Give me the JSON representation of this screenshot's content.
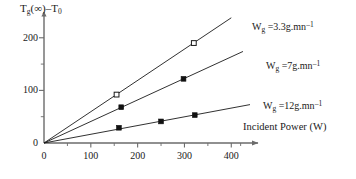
{
  "chart_data": {
    "type": "scatter",
    "title": "",
    "subtitle": "",
    "ylabel": "Tg(∞)–T0",
    "ylabel_parts": {
      "base": "T",
      "sub": "g",
      "mid": "(∞)–T",
      "sub2": "0"
    },
    "xlabel": "Incident Power (W)",
    "xlim": [
      0,
      440
    ],
    "ylim": [
      0,
      230
    ],
    "xticks": [
      0,
      100,
      200,
      300,
      400
    ],
    "xticklabels": [
      "0",
      "100",
      "200",
      "300",
      "400"
    ],
    "xminorticks": [
      50,
      150,
      250,
      350,
      420
    ],
    "yticks": [
      0,
      50,
      100,
      150,
      200
    ],
    "yticklabels": [
      "0",
      "",
      "100",
      "",
      "200"
    ],
    "grid": false,
    "legend_position": "inline-right-end-of-line",
    "axis_color": "#6b6b6b",
    "line_color": "#1a1a1a",
    "marker_fill": "#111111",
    "series": [
      {
        "name": "Wg = 3.3 g.mn-1",
        "label_parts": {
          "w": "W",
          "sub": "g",
          "eq": " =",
          "value": "3.3",
          "unit": "g.mn",
          "exp": "–1"
        },
        "slope": 0.595,
        "marker": "open-square",
        "x": [
          155,
          320
        ],
        "y": [
          92,
          190
        ],
        "line_x": [
          0,
          400
        ],
        "line_y": [
          0,
          238
        ]
      },
      {
        "name": "Wg = 7 g.mn-1",
        "label_parts": {
          "w": "W",
          "sub": "g",
          "eq": " =",
          "value": "7",
          "unit": "g.mn",
          "exp": "–1"
        },
        "slope": 0.41,
        "marker": "filled-square",
        "x": [
          165,
          298
        ],
        "y": [
          68,
          122
        ],
        "line_x": [
          0,
          425
        ],
        "line_y": [
          0,
          174
        ]
      },
      {
        "name": "Wg = 12 g.mn-1",
        "label_parts": {
          "w": "W",
          "sub": "g",
          "eq": " =",
          "value": "12",
          "unit": "g.mn",
          "exp": "–1"
        },
        "slope": 0.166,
        "marker": "filled-square",
        "x": [
          160,
          250,
          322
        ],
        "y": [
          29,
          41,
          53
        ],
        "line_x": [
          0,
          440
        ],
        "line_y": [
          0,
          73
        ]
      }
    ]
  }
}
